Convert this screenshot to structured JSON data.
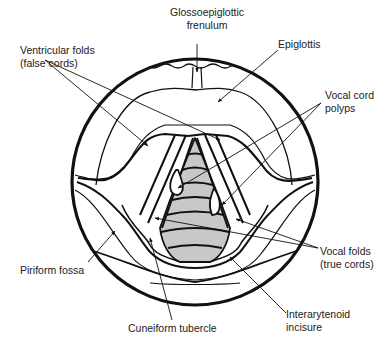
{
  "diagram": {
    "labels": {
      "glossoepiglottic": {
        "line1": "Glossoepiglottic",
        "line2": "frenulum"
      },
      "epiglottis": {
        "line1": "Epiglottis"
      },
      "ventricular": {
        "line1": "Ventricular folds",
        "line2": "(false cords)"
      },
      "polyps": {
        "line1": "Vocal cord",
        "line2": "polyps"
      },
      "vocal_folds": {
        "line1": "Vocal folds",
        "line2": "(true cords)"
      },
      "piriform": {
        "line1": "Piriform fossa"
      },
      "cuneiform": {
        "line1": "Cuneiform tubercle"
      },
      "interarytenoid": {
        "line1": "Interarytenoid",
        "line2": "incisure"
      }
    },
    "colors": {
      "stroke": "#111111",
      "trachea_fill": "#c8c8c8",
      "background": "#ffffff"
    }
  }
}
